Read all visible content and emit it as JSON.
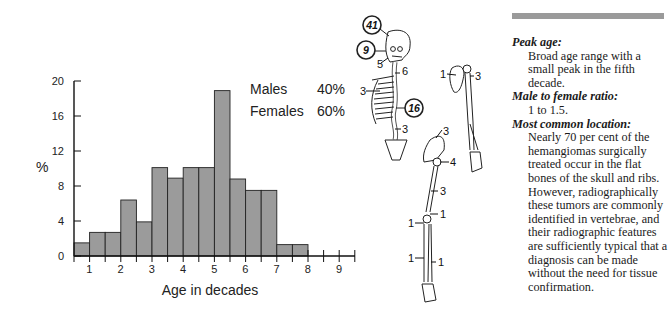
{
  "chart_data": {
    "type": "bar",
    "title": "",
    "xlabel": "Age in decades",
    "ylabel": "%",
    "ylim": [
      0,
      20
    ],
    "yticks": [
      0,
      4,
      8,
      12,
      16,
      20
    ],
    "xtick_labels": [
      "1",
      "2",
      "3",
      "4",
      "5",
      "6",
      "7",
      "8",
      "9"
    ],
    "bin_width_decades": 0.5,
    "categories": [
      "0.5-1",
      "1-1.5",
      "1.5-2",
      "2-2.5",
      "2.5-3",
      "3-3.5",
      "3.5-4",
      "4-4.5",
      "4.5-5",
      "5-5.5",
      "5.5-6",
      "6-6.5",
      "6.5-7",
      "7-7.5",
      "7.5-8",
      "8-8.5",
      "8.5-9",
      "9-9.5"
    ],
    "values": [
      1.5,
      2.7,
      2.7,
      6.4,
      3.9,
      10.1,
      8.9,
      10.1,
      10.1,
      18.9,
      8.8,
      7.5,
      7.5,
      1.3,
      1.3,
      0,
      0,
      0
    ],
    "grid": false,
    "bar_color": "#9b9b9b",
    "annotations": [
      {
        "label": "Males",
        "value": "40%"
      },
      {
        "label": "Females",
        "value": "60%"
      }
    ]
  },
  "chart": {
    "ylabel": "%",
    "xlabel": "Age in decades",
    "legend": {
      "males_label": "Males",
      "males_value": "40%",
      "females_label": "Females",
      "females_value": "60%"
    }
  },
  "skeleton": {
    "labels": {
      "skull_circled": "41",
      "jaw_circled": "9",
      "cervical": "5",
      "upper_spine": "6",
      "ribs": "3",
      "thoracic_circled": "16",
      "lumbar": "3",
      "scapula": "1",
      "humerus_head": "3",
      "pelvis": "3",
      "hip": "4",
      "femur": "3",
      "distal_femur": "1",
      "patella": "1",
      "tibia": "1",
      "fibula": "1"
    }
  },
  "text_panel": {
    "sections": [
      {
        "heading": "Peak age:",
        "body": "Broad age range with a small peak in the fifth decade."
      },
      {
        "heading": "Male to female ratio:",
        "body": "1 to 1.5."
      },
      {
        "heading": "Most common location:",
        "body": "Nearly 70 per cent of the hemangiomas surgically treated occur in the flat bones of the skull and ribs. However, radiographically these tumors are commonly identified in vertebrae, and their radiographic features are sufficiently typical that a diagnosis can be made without the need for tissue confirmation."
      }
    ]
  }
}
